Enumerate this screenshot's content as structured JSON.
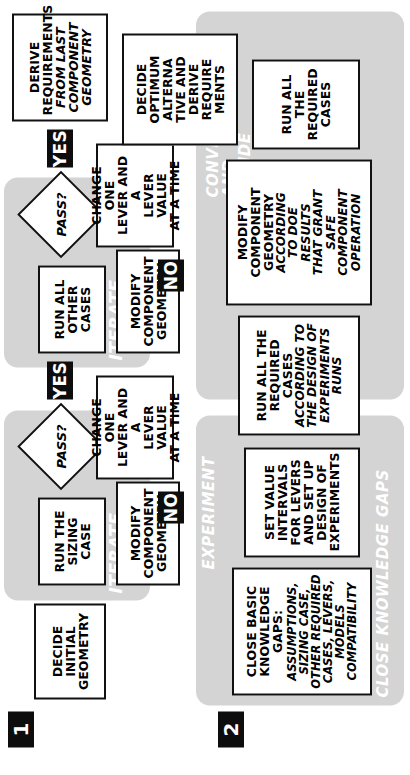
{
  "diagram": {
    "colors": {
      "group_fill": "#d4d4d4",
      "node_fill": "#ffffff",
      "node_stroke": "#111111",
      "badge_fill": "#0d0d0d",
      "badge_text": "#ffffff",
      "group_label_text": "#ffffff",
      "page_background": "#ffffff"
    }
  },
  "steps": [
    {
      "id": "step-1",
      "label": "1"
    },
    {
      "id": "step-2",
      "label": "2"
    }
  ],
  "groups": [
    {
      "id": "iterate-1",
      "label": "ITERATE"
    },
    {
      "id": "iterate-2",
      "label": "ITERATE"
    },
    {
      "id": "close-knowledge-gaps",
      "label": "CLOSE KNOWLEDGE GAPS"
    },
    {
      "id": "experiment",
      "label": "EXPERIMENT"
    },
    {
      "id": "converge-and-decide",
      "label": "CONVERGE\nAND\nDECIDE"
    }
  ],
  "row1": {
    "decide_initial_geometry": "DECIDE\nINITIAL\nGEOMETRY",
    "run_the_sizing_case": "RUN THE\nSIZING\nCASE",
    "modify_component_geometry_a": "MODIFY\nCOMPONENT\nGEOMETRY",
    "change_one_lever_a": "CHANGE ONE\nLEVER AND A\nLEVER VALUE\nAT A TIME",
    "pass_a": "PASS?",
    "yes_a": "YES",
    "no_a": "NO",
    "run_all_other_cases": "RUN ALL\nOTHER\nCASES",
    "modify_component_geometry_b": "MODIFY\nCOMPONENT\nGEOMETRY",
    "change_one_lever_b": "CHANGE ONE\nLEVER AND A\nLEVER VALUE\nAT A TIME",
    "pass_b": "PASS?",
    "yes_b": "YES",
    "no_b": "NO",
    "derive_requirements_bold": "DERIVE\nREQUIREMENTS",
    "derive_requirements_ital": "FROM LAST\nCOMPONENT\nGEOMETRY"
  },
  "row2": {
    "close_gaps_bold": "CLOSE BASIC\nKNOWLEDGE\nGAPS:",
    "close_gaps_ital": "ASSUMPTIONS,\nSIZING CASE,\nOTHER REQUIRED\nCASES, LEVERS,\nMODELS\nCOMPATIBILITY",
    "set_value_intervals": "SET VALUE\nINTERVALS\nFOR LEVERS\nAND SET UP\nDESIGN OF\nEXPERIMENTS",
    "run_required_cases_bold": "RUN ALL THE\nREQUIRED\nCASES",
    "run_required_cases_ital": "ACCORDING TO\nTHE DESIGN OF\nEXPERIMENTS\nRUNS",
    "modify_geometry_doe_bold": "MODIFY\nCOMPONENT\nGEOMETRY",
    "modify_geometry_doe_ital": "ACCORDING\nTO DOE\nRESULTS\nTHAT GRANT\nSAFE\nCOMPONENT\nOPERATION",
    "run_all_required_cases": "RUN ALL\nTHE\nREQUIRED\nCASES",
    "decide_optimum": "DECIDE\nOPTIMUM\nALTERNA\nTIVE AND\nDERIVE\nREQUIRE\nMENTS"
  }
}
